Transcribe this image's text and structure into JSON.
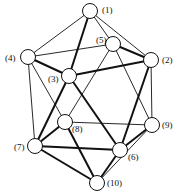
{
  "diagram": {
    "nodes": [
      {
        "id": "1",
        "label": "(1)",
        "x": 90,
        "y": 11,
        "lx": 102,
        "ly": 13
      },
      {
        "id": "2",
        "label": "(2)",
        "x": 151,
        "y": 60,
        "lx": 162,
        "ly": 63
      },
      {
        "id": "3",
        "label": "(3)",
        "x": 69,
        "y": 76,
        "lx": 48,
        "ly": 82
      },
      {
        "id": "4",
        "label": "(4)",
        "x": 28,
        "y": 57,
        "lx": 5,
        "ly": 61
      },
      {
        "id": "5",
        "label": "(5)",
        "x": 113,
        "y": 44,
        "lx": 96,
        "ly": 43
      },
      {
        "id": "6",
        "label": "(6)",
        "x": 120,
        "y": 150,
        "lx": 128,
        "ly": 160
      },
      {
        "id": "7",
        "label": "(7)",
        "x": 35,
        "y": 146,
        "lx": 14,
        "ly": 150
      },
      {
        "id": "8",
        "label": "(8)",
        "x": 65,
        "y": 122,
        "lx": 72,
        "ly": 132
      },
      {
        "id": "9",
        "label": "(9)",
        "x": 152,
        "y": 125,
        "lx": 162,
        "ly": 128
      },
      {
        "id": "10",
        "label": "(10)",
        "x": 97,
        "y": 183,
        "lx": 107,
        "ly": 186
      }
    ],
    "edges": [
      [
        "1",
        "4",
        1
      ],
      [
        "1",
        "5",
        1
      ],
      [
        "1",
        "2",
        1
      ],
      [
        "1",
        "3",
        2
      ],
      [
        "4",
        "5",
        1
      ],
      [
        "4",
        "3",
        2
      ],
      [
        "4",
        "7",
        1
      ],
      [
        "4",
        "8",
        1
      ],
      [
        "5",
        "2",
        2
      ],
      [
        "5",
        "8",
        1
      ],
      [
        "5",
        "9",
        1
      ],
      [
        "3",
        "2",
        2
      ],
      [
        "3",
        "7",
        2
      ],
      [
        "3",
        "6",
        2
      ],
      [
        "2",
        "9",
        1
      ],
      [
        "2",
        "6",
        2
      ],
      [
        "8",
        "7",
        2
      ],
      [
        "8",
        "9",
        1
      ],
      [
        "8",
        "10",
        2
      ],
      [
        "7",
        "6",
        2
      ],
      [
        "7",
        "10",
        2
      ],
      [
        "6",
        "9",
        2
      ],
      [
        "6",
        "10",
        2
      ],
      [
        "9",
        "10",
        1
      ]
    ]
  }
}
